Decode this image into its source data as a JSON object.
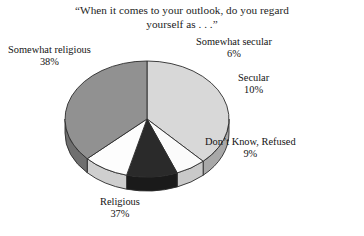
{
  "title": {
    "line1": "“When it comes to your outlook, do you regard",
    "line2": "yourself as . . .”"
  },
  "labels": {
    "somewhat_religious": {
      "name": "Somewhat religious",
      "pct": "38%"
    },
    "somewhat_secular": {
      "name": "Somewhat secular",
      "pct": "6%"
    },
    "secular": {
      "name": "Secular",
      "pct": "10%"
    },
    "dont_know": {
      "name": "Don’t Know, Refused",
      "pct": "9%"
    },
    "religious": {
      "name": "Religious",
      "pct": "37%"
    }
  },
  "chart_data": {
    "type": "pie",
    "title": "“When it comes to your outlook, do you regard yourself as . . .”",
    "categories": [
      "Somewhat religious",
      "Somewhat secular",
      "Secular",
      "Don’t Know, Refused",
      "Religious"
    ],
    "values": [
      38,
      6,
      10,
      9,
      37
    ],
    "value_labels": [
      "38%",
      "6%",
      "10%",
      "9%",
      "37%"
    ],
    "unit": "percent",
    "total": 100,
    "colors": [
      "#d8d8d8",
      "#fbfbfb",
      "#2a2a2a",
      "#fdfdfd",
      "#919191"
    ],
    "side_colors": [
      "#a8a8a8",
      "#c9c9c9",
      "#1a1a1a",
      "#cfcfcf",
      "#6f6f6f"
    ],
    "stroke": "#2b2b2b",
    "legend": "none",
    "labels_position": "outside",
    "three_d": true,
    "start_angle_deg": -90,
    "direction": "clockwise"
  }
}
